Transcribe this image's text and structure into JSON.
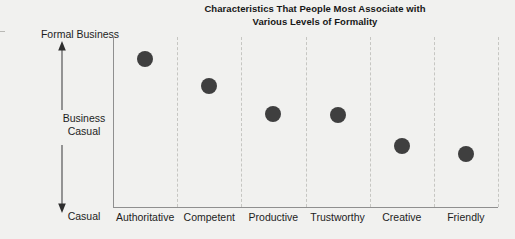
{
  "chart_data": {
    "type": "scatter",
    "title": "Characteristics That People Most Associate with Various Levels of Formality",
    "title_line_1": "Characteristics That People Most Associate with",
    "title_line_2": "Various Levels of Formality",
    "xlabel": "",
    "ylabel": "Level of Formality",
    "categories": [
      "Authoritative",
      "Competent",
      "Productive",
      "Trustworthy",
      "Creative",
      "Friendly"
    ],
    "values": [
      0.87,
      0.71,
      0.55,
      0.54,
      0.36,
      0.31
    ],
    "ylim": [
      0,
      1
    ],
    "y_scale_labels": [
      "Formal Business",
      "Business\nCasual",
      "Casual"
    ],
    "y_axis_type": "ordinal-scale-arrow",
    "y_tick_positions": [
      1.0,
      0.5,
      0.0
    ],
    "grid": "vertical-dashed",
    "legend": "none",
    "marker_color": "#3f3f3f",
    "marker_shape": "circle",
    "background_color": "#f1f1ef",
    "axis_color": "#8f8f8f",
    "gridline_color": "#c6c6c2",
    "points": [
      {
        "category": "Authoritative",
        "value": 0.87,
        "formality": "Formal Business"
      },
      {
        "category": "Competent",
        "value": 0.71,
        "formality": "Formal Business"
      },
      {
        "category": "Productive",
        "value": 0.55,
        "formality": "Business Casual"
      },
      {
        "category": "Trustworthy",
        "value": 0.54,
        "formality": "Business Casual"
      },
      {
        "category": "Creative",
        "value": 0.36,
        "formality": "Business Casual"
      },
      {
        "category": "Friendly",
        "value": 0.31,
        "formality": "Business Casual"
      }
    ]
  },
  "scale": {
    "top_label": "Formal Business",
    "mid_label": "Business\nCasual",
    "bottom_label": "Casual"
  }
}
